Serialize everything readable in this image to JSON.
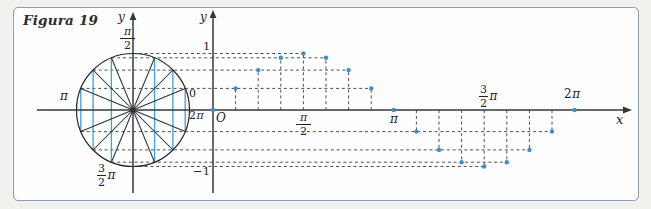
{
  "figure": {
    "title": "Figura 19"
  },
  "colors": {
    "border": "#8b9cb8",
    "background_outer": "#f3f1ed",
    "background_inner": "#fefefe",
    "axis": "#33383c",
    "dashed_line": "#4c4f52",
    "data_point": "#3d8fc9",
    "chord": "#3aa2da",
    "circle_stroke": "#24282c",
    "label_text": "#1f2326"
  },
  "left_plot": {
    "y_axis_label": "y",
    "angle_labels": {
      "top_num": "π",
      "top_den": "2",
      "left": "π",
      "bottom_num": "3",
      "bottom_den": "2",
      "bottom_suffix": "π",
      "right_above": "0",
      "right_below_coef": "2",
      "right_below_pi": "π"
    }
  },
  "right_plot": {
    "y_axis_label": "y",
    "x_axis_label": "x",
    "origin_label": "O",
    "y_ticks": {
      "pos": "1",
      "neg": "−1"
    },
    "x_ticks": {
      "half_pi_num": "π",
      "half_pi_den": "2",
      "pi": "π",
      "three_half_num": "3",
      "three_half_den": "2",
      "three_half_suffix": "π",
      "two_pi_coef": "2",
      "two_pi_pi": "π"
    }
  },
  "chart_data": {
    "type": "scatter",
    "title": "Figura 19",
    "x_unit": "radians",
    "k_unit": "π/8",
    "x_tick_labels": [
      "π/2",
      "π",
      "3/2 π",
      "2π"
    ],
    "y_tick_labels": [
      "1",
      "−1"
    ],
    "ylim": [
      -1,
      1
    ],
    "xlim_labels": [
      "0",
      "2π"
    ],
    "grid": false,
    "points": [
      {
        "k": 0,
        "y": 0
      },
      {
        "k": 1,
        "y": 0.383
      },
      {
        "k": 2,
        "y": 0.707
      },
      {
        "k": 3,
        "y": 0.924
      },
      {
        "k": 4,
        "y": 1
      },
      {
        "k": 5,
        "y": 0.924
      },
      {
        "k": 6,
        "y": 0.707
      },
      {
        "k": 7,
        "y": 0.383
      },
      {
        "k": 8,
        "y": 0
      },
      {
        "k": 9,
        "y": -0.383
      },
      {
        "k": 10,
        "y": -0.707
      },
      {
        "k": 11,
        "y": -0.924
      },
      {
        "k": 12,
        "y": -1
      },
      {
        "k": 13,
        "y": -0.924
      },
      {
        "k": 14,
        "y": -0.707
      },
      {
        "k": 15,
        "y": -0.383
      },
      {
        "k": 16,
        "y": 0
      }
    ],
    "unit_circle": {
      "divisions": 16,
      "angle_step_deg": 22.5,
      "spoke_diameter_angles_deg": [
        22.5,
        45,
        67.5,
        112.5,
        135,
        157.5
      ],
      "chord_cosines": [
        0.924,
        0.707,
        0.383
      ],
      "angle_labels": [
        "π/2",
        "π",
        "3/2 π",
        "0",
        "2π"
      ]
    }
  }
}
